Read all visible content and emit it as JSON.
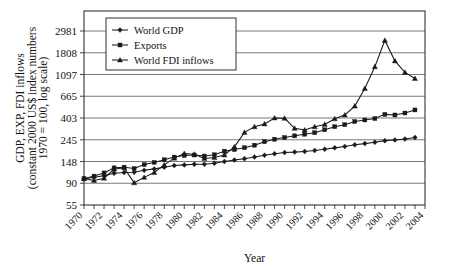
{
  "figure": {
    "background": "#ffffff",
    "ink": "#1a1a1a"
  },
  "chart_data": {
    "type": "line",
    "title": "",
    "xlabel": "Year",
    "ylabel": "GDP, EXP, FDI inflows (constant 2000 US$ index numbers 1970 = 100, log scale)",
    "ylabel_line1": "GDP, EXP, FDI inflows",
    "ylabel_line2": "(constant 2000 US$ index numbers",
    "ylabel_line3": "1970 = 100, log scale)",
    "yscale": "log",
    "ylim": [
      55,
      4000
    ],
    "ytick_labels": [
      "2981",
      "1808",
      "1097",
      "665",
      "403",
      "245",
      "148",
      "90",
      "55"
    ],
    "ytick_values": [
      2981,
      1808,
      1097,
      665,
      403,
      245,
      148,
      90,
      55
    ],
    "grid": true,
    "legend_position": "upper-left-inside",
    "xlim": [
      1970,
      2004
    ],
    "xtick_labels": [
      "1970",
      "1972",
      "1974",
      "1976",
      "1978",
      "1980",
      "1982",
      "1984",
      "1986",
      "1988",
      "1990",
      "1992",
      "1994",
      "1996",
      "1998",
      "2000",
      "2002",
      "2004"
    ],
    "x": [
      1970,
      1971,
      1972,
      1973,
      1974,
      1975,
      1976,
      1977,
      1978,
      1979,
      1980,
      1981,
      1982,
      1983,
      1984,
      1985,
      1986,
      1987,
      1988,
      1989,
      1990,
      1991,
      1992,
      1993,
      1994,
      1995,
      1996,
      1997,
      1998,
      1999,
      2000,
      2001,
      2002,
      2003
    ],
    "series": [
      {
        "name": "World GDP",
        "marker": "diamond",
        "values": [
          100,
          103,
          107,
          113,
          115,
          116,
          121,
          125,
          130,
          135,
          137,
          139,
          139,
          142,
          148,
          153,
          158,
          164,
          171,
          177,
          182,
          184,
          187,
          191,
          197,
          203,
          210,
          218,
          224,
          231,
          240,
          244,
          249,
          258
        ]
      },
      {
        "name": "Exports",
        "marker": "square",
        "values": [
          100,
          106,
          114,
          128,
          130,
          126,
          138,
          145,
          154,
          164,
          170,
          172,
          168,
          173,
          188,
          195,
          204,
          216,
          234,
          248,
          258,
          268,
          278,
          288,
          308,
          330,
          346,
          372,
          385,
          398,
          438,
          432,
          452,
          485
        ]
      },
      {
        "name": "World FDI inflows",
        "marker": "triangle",
        "values": [
          100,
          96,
          101,
          124,
          128,
          91,
          103,
          115,
          137,
          160,
          178,
          175,
          159,
          162,
          172,
          208,
          290,
          330,
          352,
          403,
          400,
          318,
          306,
          330,
          348,
          396,
          432,
          530,
          795,
          1310,
          2400,
          1500,
          1150,
          1000
        ]
      }
    ]
  },
  "legend": {
    "items": [
      {
        "label": "World GDP",
        "marker": "diamond"
      },
      {
        "label": "Exports",
        "marker": "square"
      },
      {
        "label": "World FDI inflows",
        "marker": "triangle"
      }
    ]
  }
}
